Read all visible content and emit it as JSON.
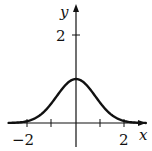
{
  "chart_data": {
    "type": "line",
    "title": "",
    "xlabel": "x",
    "ylabel": "y",
    "x_ticks": [
      -2,
      -1,
      1,
      2
    ],
    "x_tick_labels": [
      "−2",
      "2"
    ],
    "y_ticks": [
      2
    ],
    "y_tick_labels": [
      "2"
    ],
    "xlim": [
      -2.7,
      2.8
    ],
    "ylim": [
      -0.55,
      2.65
    ],
    "grid": false,
    "legend": null,
    "series": [
      {
        "name": "bell curve",
        "x": [
          -2.6,
          -2,
          -1.5,
          -1,
          -0.5,
          0,
          0.5,
          1,
          1.5,
          2,
          2.6
        ],
        "y": [
          0.0,
          0.02,
          0.15,
          0.45,
          0.82,
          1.0,
          0.82,
          0.45,
          0.15,
          0.02,
          0.0
        ]
      }
    ],
    "colors": {
      "curve": "#111111",
      "axes": "#111111"
    }
  },
  "labels": {
    "x_axis": "x",
    "y_axis": "y",
    "tick_neg2": "−2",
    "tick_pos2": "2",
    "tick_y2": "2"
  }
}
